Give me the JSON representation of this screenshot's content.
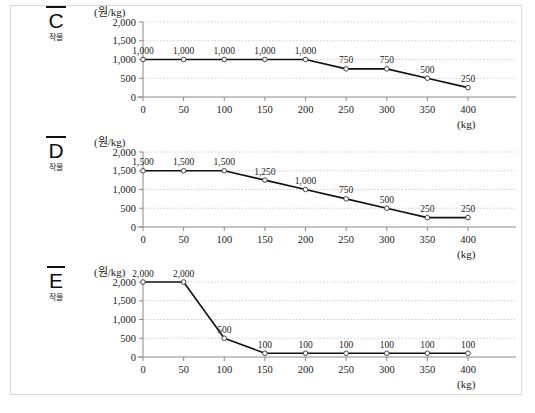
{
  "figure": {
    "background": "#ffffff",
    "border_color": "#d8d8d8"
  },
  "axis": {
    "y_unit": "(원/kg)",
    "x_unit": "(kg)",
    "y_ticks": [
      "0",
      "500",
      "1,000",
      "1,500",
      "2,000"
    ],
    "x_ticks": [
      "0",
      "50",
      "100",
      "150",
      "200",
      "250",
      "300",
      "350",
      "400"
    ]
  },
  "colors": {
    "line": "#111111",
    "grid": "#b9b9c9",
    "axis": "#8a8a8a",
    "marker_fill": "#ffffff",
    "marker_stroke": "#333333",
    "text": "#1a1a1a"
  },
  "charts": [
    {
      "id": "chart-c",
      "crop_letter": "C",
      "crop_word": "작물",
      "chart_data": {
        "type": "line",
        "title": "C 작물",
        "xlabel": "(kg)",
        "ylabel": "(원/kg)",
        "xlim": [
          0,
          400
        ],
        "ylim": [
          0,
          2000
        ],
        "grid": true,
        "legend": "none",
        "x": [
          0,
          50,
          100,
          150,
          200,
          250,
          300,
          350,
          400
        ],
        "values": [
          1000,
          1000,
          1000,
          1000,
          1000,
          750,
          750,
          500,
          250
        ],
        "point_labels": [
          "1,000",
          "1,000",
          "1,000",
          "1,000",
          "1,000",
          "750",
          "750",
          "500",
          "250"
        ]
      }
    },
    {
      "id": "chart-d",
      "crop_letter": "D",
      "crop_word": "작물",
      "chart_data": {
        "type": "line",
        "title": "D 작물",
        "xlabel": "(kg)",
        "ylabel": "(원/kg)",
        "xlim": [
          0,
          400
        ],
        "ylim": [
          0,
          2000
        ],
        "grid": true,
        "legend": "none",
        "x": [
          0,
          50,
          100,
          150,
          200,
          250,
          300,
          350,
          400
        ],
        "values": [
          1500,
          1500,
          1500,
          1250,
          1000,
          750,
          500,
          250,
          250
        ],
        "point_labels": [
          "1,500",
          "1,500",
          "1,500",
          "1,250",
          "1,000",
          "750",
          "500",
          "250",
          "250"
        ]
      }
    },
    {
      "id": "chart-e",
      "crop_letter": "E",
      "crop_word": "작물",
      "chart_data": {
        "type": "line",
        "title": "E 작물",
        "xlabel": "(kg)",
        "ylabel": "(원/kg)",
        "xlim": [
          0,
          400
        ],
        "ylim": [
          0,
          2000
        ],
        "grid": true,
        "legend": "none",
        "x": [
          0,
          50,
          100,
          150,
          200,
          250,
          300,
          350,
          400
        ],
        "values": [
          2000,
          2000,
          500,
          100,
          100,
          100,
          100,
          100,
          100
        ],
        "point_labels": [
          "2,000",
          "2,000",
          "500",
          "100",
          "100",
          "100",
          "100",
          "100",
          "100"
        ]
      }
    }
  ]
}
